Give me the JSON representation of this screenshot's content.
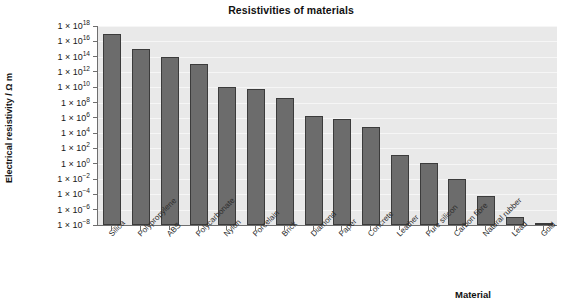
{
  "chart_data": {
    "type": "bar",
    "title": "Resistivities of materials",
    "xlabel": "Material",
    "ylabel": "Electrical resistivity / Ω m",
    "yscale": "log",
    "ylim": [
      1e-08,
      1e+18
    ],
    "grid": true,
    "legend": null,
    "y_tick_labels": [
      "1 × 10^18",
      "1 × 10^16",
      "1 × 10^14",
      "1 × 10^12",
      "1 × 10^10",
      "1 × 10^8",
      "1 × 10^6",
      "1 × 10^4",
      "1 × 10^2",
      "1 × 10^0",
      "1 × 10^-2",
      "1 × 10^-4",
      "1 × 10^-6",
      "1 × 10^-8"
    ],
    "y_tick_exponents": [
      18,
      16,
      14,
      12,
      10,
      8,
      6,
      4,
      2,
      0,
      -2,
      -4,
      -6,
      -8
    ],
    "categories": [
      "Silica",
      "Polypropylene",
      "ABS",
      "Polycarbonate",
      "Nylon",
      "Porcelain",
      "Brick",
      "Diamond",
      "Paper",
      "Concrete",
      "Leather",
      "Pure silicon",
      "Carbon fibre",
      "Natural rubber",
      "Lead",
      "Gold"
    ],
    "values": [
      1e+17,
      1000000000000000.0,
      100000000000000.0,
      10000000000000.0,
      10000000000.0,
      10000000000.0,
      1000000000.0,
      1000000.0,
      1000000.0,
      100000.0,
      10.0,
      1.0,
      0.01,
      0.0001,
      1e-07,
      2.5e-08
    ],
    "value_exponents": [
      17,
      15,
      14,
      13,
      10,
      9.8,
      8.6,
      6.3,
      5.8,
      4.8,
      1.2,
      0.1,
      -2,
      -4.2,
      -7,
      -7.8
    ],
    "bar_color": "#6c6c6c",
    "bar_edge_color": "#3b3b3b",
    "plot_background": "#e9e9e9",
    "gridline_color": "#f6f6f6",
    "axis_color": "#6f6f6f"
  }
}
